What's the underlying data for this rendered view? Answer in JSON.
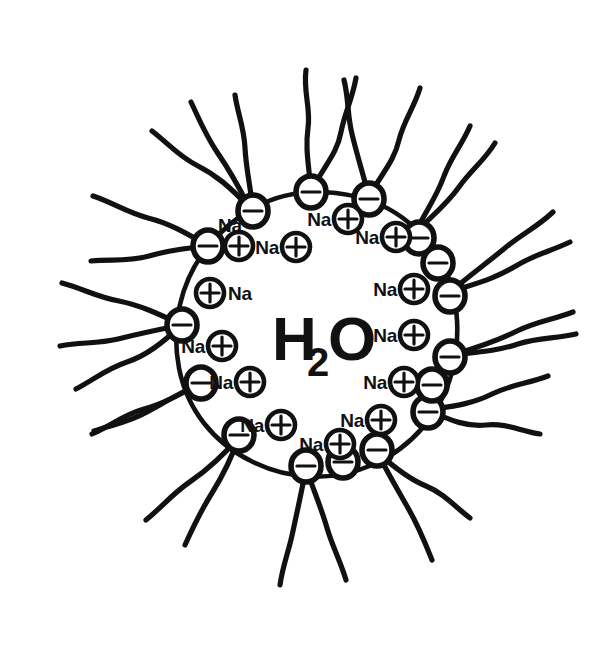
{
  "figure": {
    "kind": "hand-drawn-scientific-diagram",
    "ink_color": "#111111",
    "background_color": "#ffffff",
    "width": 613,
    "height": 645
  },
  "core": {
    "label_main": "H",
    "label_subscript": "2",
    "label_tail": "O",
    "label_full": "H2O",
    "center_x": 316,
    "center_y": 332,
    "radius": 140
  },
  "legend_glyphs": {
    "negative": "−",
    "positive": "+",
    "counterion_symbol": "Na"
  },
  "head_groups": [
    {
      "id": "head-1",
      "charge": "−",
      "angle_deg": 268,
      "cx": 311,
      "cy": 192
    },
    {
      "id": "head-2",
      "charge": "−",
      "angle_deg": 292,
      "cx": 369,
      "cy": 197
    },
    {
      "id": "head-3",
      "charge": "−",
      "angle_deg": 315,
      "cx": 415,
      "cy": 233
    },
    {
      "id": "head-4",
      "charge": "−",
      "angle_deg": 343,
      "cx": 450,
      "cy": 292
    },
    {
      "id": "head-5",
      "charge": "−",
      "angle_deg": 10,
      "cx": 452,
      "cy": 355
    },
    {
      "id": "head-6",
      "charge": "−",
      "angle_deg": 36,
      "cx": 428,
      "cy": 410
    },
    {
      "id": "head-7",
      "charge": "−",
      "angle_deg": 62,
      "cx": 377,
      "cy": 452
    },
    {
      "id": "head-8",
      "charge": "−",
      "angle_deg": 88,
      "cx": 306,
      "cy": 468
    },
    {
      "id": "head-9",
      "charge": "−",
      "angle_deg": 114,
      "cx": 239,
      "cy": 437
    },
    {
      "id": "head-10",
      "charge": "−",
      "angle_deg": 140,
      "cx": 201,
      "cy": 383
    },
    {
      "id": "head-11",
      "charge": "−",
      "angle_deg": 168,
      "cx": 182,
      "cy": 325
    },
    {
      "id": "head-12",
      "charge": "−",
      "angle_deg": 196,
      "cx": 208,
      "cy": 246
    },
    {
      "id": "head-13",
      "charge": "−",
      "angle_deg": 222,
      "cx": 249,
      "cy": 207
    },
    {
      "id": "head-14",
      "charge": "−",
      "angle_deg": 248,
      "cx": 253,
      "cy": 210
    }
  ],
  "counterions": [
    {
      "id": "ion-1",
      "charge": "+",
      "label": "Na",
      "label_side": "left",
      "cx": 342,
      "cy": 217
    },
    {
      "id": "ion-2",
      "charge": "+",
      "label": "Na",
      "label_side": "left",
      "cx": 393,
      "cy": 234
    },
    {
      "id": "ion-3",
      "charge": "+",
      "label": "Na",
      "label_side": "left",
      "cx": 412,
      "cy": 288
    },
    {
      "id": "ion-4",
      "charge": "+",
      "label": "Na",
      "label_side": "left",
      "cx": 413,
      "cy": 334
    },
    {
      "id": "ion-5",
      "charge": "+",
      "label": "Na",
      "label_side": "left",
      "cx": 404,
      "cy": 381
    },
    {
      "id": "ion-6",
      "charge": "+",
      "label": "Na",
      "label_side": "left",
      "cx": 379,
      "cy": 419
    },
    {
      "id": "ion-7",
      "charge": "+",
      "label": "Na",
      "label_side": "left",
      "cx": 332,
      "cy": 441
    },
    {
      "id": "ion-8",
      "charge": "+",
      "label": "Na",
      "label_side": "left",
      "cx": 278,
      "cy": 424
    },
    {
      "id": "ion-9",
      "charge": "+",
      "label": "Na",
      "label_side": "left",
      "cx": 248,
      "cy": 381
    },
    {
      "id": "ion-10",
      "charge": "+",
      "label": "Na",
      "label_side": "left",
      "cx": 221,
      "cy": 345
    },
    {
      "id": "ion-11",
      "charge": "+",
      "label": "Na",
      "label_side": "right",
      "cx": 208,
      "cy": 292
    },
    {
      "id": "ion-12",
      "charge": "+",
      "label": "Na",
      "label_side": "above",
      "cx": 237,
      "cy": 244
    },
    {
      "id": "ion-13",
      "charge": "+",
      "label": "Na",
      "label_side": "left",
      "cx": 294,
      "cy": 245
    }
  ],
  "tails": {
    "count_per_head": 2,
    "description": "wavy hydrophobic hydrocarbon chains radiating outward"
  }
}
